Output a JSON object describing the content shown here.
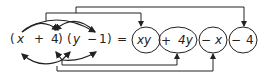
{
  "lhs": {
    "factor1": {
      "open": "(",
      "a": "x",
      "op": "+",
      "b": "4",
      "close": ")"
    },
    "factor2": {
      "open": "(",
      "a": "y",
      "op": "−",
      "b": "1",
      "close": ")"
    }
  },
  "equals": "=",
  "rhs": {
    "terms": [
      {
        "sign": "",
        "text": "xy"
      },
      {
        "sign": "+",
        "text": "4y"
      },
      {
        "sign": "−",
        "text": "x"
      },
      {
        "sign": "−",
        "text": "4"
      }
    ]
  },
  "colors": {
    "ink": "#222222",
    "background": "#ffffff"
  }
}
